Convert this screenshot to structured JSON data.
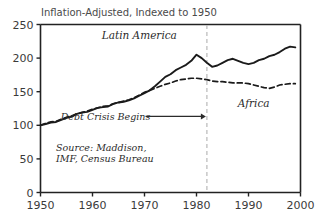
{
  "chart_data": {
    "type": "line",
    "title": "Inflation-Adjusted, Indexed to 1950",
    "xlabel": "",
    "ylabel": "",
    "xlim": [
      1950,
      2000
    ],
    "ylim": [
      0,
      250
    ],
    "grid": false,
    "legend_position": "inline-labels",
    "x_ticks": [
      "1950",
      "1960",
      "1970",
      "1980",
      "1990",
      "2000"
    ],
    "x_tick_values": [
      1950,
      1960,
      1970,
      1980,
      1990,
      2000
    ],
    "y_ticks": [
      "0",
      "50",
      "100",
      "150",
      "200",
      "250"
    ],
    "y_tick_values": [
      0,
      50,
      100,
      150,
      200,
      250
    ],
    "x": [
      1950,
      1951,
      1952,
      1953,
      1954,
      1955,
      1956,
      1957,
      1958,
      1959,
      1960,
      1961,
      1962,
      1963,
      1964,
      1965,
      1966,
      1967,
      1968,
      1969,
      1970,
      1971,
      1972,
      1973,
      1974,
      1975,
      1976,
      1977,
      1978,
      1979,
      1980,
      1981,
      1982,
      1983,
      1984,
      1985,
      1986,
      1987,
      1988,
      1989,
      1990,
      1991,
      1992,
      1993,
      1994,
      1995,
      1996,
      1997,
      1998,
      1999
    ],
    "series": [
      {
        "name": "Latin America",
        "style": "solid",
        "color": "#1a1a1a",
        "label_x": 1969,
        "label_y": 228,
        "values": [
          100,
          102,
          104,
          105,
          108,
          111,
          113,
          117,
          119,
          120,
          123,
          126,
          127,
          128,
          132,
          134,
          135,
          137,
          140,
          144,
          148,
          152,
          158,
          165,
          172,
          176,
          182,
          186,
          190,
          196,
          205,
          200,
          193,
          187,
          189,
          193,
          197,
          199,
          196,
          193,
          191,
          193,
          197,
          199,
          203,
          205,
          209,
          214,
          217,
          216
        ]
      },
      {
        "name": "Africa",
        "style": "dashed",
        "color": "#1a1a1a",
        "label_x": 1991,
        "label_y": 127,
        "values": [
          100,
          103,
          105,
          106,
          109,
          112,
          114,
          117,
          119,
          121,
          124,
          126,
          128,
          129,
          132,
          134,
          136,
          138,
          141,
          145,
          149,
          152,
          155,
          158,
          161,
          163,
          166,
          168,
          169,
          170,
          170,
          169,
          168,
          166,
          165,
          165,
          164,
          163,
          163,
          163,
          162,
          160,
          158,
          156,
          155,
          157,
          160,
          161,
          162,
          162
        ]
      }
    ],
    "annotations": [
      {
        "id": "debt-crisis",
        "text": "Debt Crisis Begins",
        "text_x": 1962.5,
        "text_y": 108,
        "arrow_to_x": 1982,
        "arrow_to_y": 108
      },
      {
        "id": "marker-line",
        "text": "",
        "marker_year": 1982,
        "style": "dashed-vertical",
        "color": "#b9b9b9"
      }
    ],
    "source_lines": [
      "Source: Maddison,",
      "IMF, Census Bureau"
    ],
    "source_x": 1953,
    "source_y": 62
  },
  "colors": {
    "axis": "#222222",
    "series": "#1a1a1a",
    "marker": "#b9b9b9",
    "text": "#3a3a3a",
    "background": "#ffffff"
  }
}
